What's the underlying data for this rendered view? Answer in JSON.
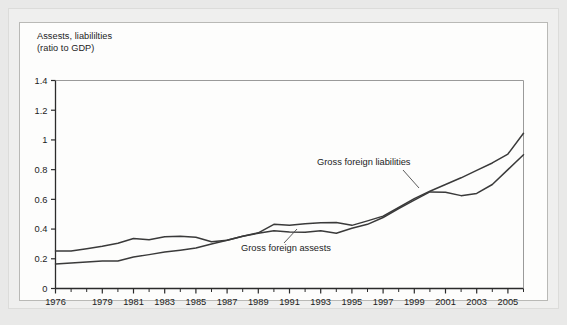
{
  "figure": {
    "title_line1": "Assests, liabililties",
    "title_line2": "(ratio to GDP)",
    "background_color": "#e9e9e8",
    "card_color": "#fdfdfc",
    "card_border_color": "#b9b9b6"
  },
  "chart_data": {
    "type": "line",
    "xlabel": "",
    "ylabel": "Assests, liabililties (ratio to GDP)",
    "xlim": [
      1976,
      2006
    ],
    "ylim": [
      0,
      1.4
    ],
    "yticks": [
      0,
      0.2,
      0.4,
      0.6,
      0.8,
      1,
      1.2,
      1.4
    ],
    "ytick_labels": [
      "0",
      "0.2",
      "0.4",
      "0.6",
      "0.8",
      "1",
      "1.2",
      "1.4"
    ],
    "xticks": [
      1976,
      1979,
      1981,
      1983,
      1985,
      1987,
      1989,
      1991,
      1993,
      1995,
      1997,
      1999,
      2001,
      2003,
      2005
    ],
    "xtick_labels": [
      "1976",
      "1979",
      "1981",
      "1983",
      "1985",
      "1987",
      "1989",
      "1991",
      "1993",
      "1995",
      "1997",
      "1999",
      "2001",
      "2003",
      "2005"
    ],
    "x_minor_step": 1,
    "grid": false,
    "legend": "none",
    "line_color": "#3a3a3a",
    "x": [
      1976,
      1977,
      1978,
      1979,
      1980,
      1981,
      1982,
      1983,
      1984,
      1985,
      1986,
      1987,
      1988,
      1989,
      1990,
      1991,
      1992,
      1993,
      1994,
      1995,
      1996,
      1997,
      1998,
      1999,
      2000,
      2001,
      2002,
      2003,
      2004,
      2005,
      2006
    ],
    "series": [
      {
        "name": "Gross foreign liabilities",
        "values": [
          0.252,
          0.253,
          0.268,
          0.285,
          0.305,
          0.337,
          0.328,
          0.348,
          0.352,
          0.345,
          0.315,
          0.325,
          0.352,
          0.375,
          0.432,
          0.425,
          0.435,
          0.443,
          0.445,
          0.425,
          0.455,
          0.487,
          0.545,
          0.605,
          0.655,
          0.7,
          0.745,
          0.795,
          0.845,
          0.905,
          1.045
        ],
        "annotation": "Gross foreign liabilities"
      },
      {
        "name": "Gross foreign assests",
        "values": [
          0.165,
          0.172,
          0.178,
          0.185,
          0.185,
          0.212,
          0.228,
          0.245,
          0.258,
          0.272,
          0.3,
          0.325,
          0.352,
          0.372,
          0.388,
          0.38,
          0.378,
          0.388,
          0.372,
          0.405,
          0.432,
          0.478,
          0.538,
          0.595,
          0.65,
          0.648,
          0.625,
          0.64,
          0.7,
          0.8,
          0.9
        ],
        "annotation": "Gross foreign assests"
      }
    ],
    "annotations": [
      {
        "text": "Gross foreign liabilities",
        "label_x": 317,
        "label_y": 165,
        "leader_from_x": 403,
        "leader_from_y": 170,
        "leader_to_x": 419,
        "leader_to_y": 188
      },
      {
        "text": "Gross foreign assests",
        "label_x": 241,
        "label_y": 251,
        "leader_from_x": 284,
        "leader_from_y": 243,
        "leader_to_x": 297,
        "leader_to_y": 229
      }
    ]
  }
}
